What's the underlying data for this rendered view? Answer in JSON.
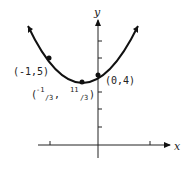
{
  "diagram": {
    "type": "parabola graph",
    "axes": {
      "x_label": "x",
      "y_label": "y"
    },
    "points": [
      {
        "label": "(-1,5)",
        "x": -1,
        "y": 5
      },
      {
        "label": "(0,4)",
        "x": 0,
        "y": 4
      },
      {
        "label_parts": {
          "open": "(",
          "x_num": "-1",
          "x_den": "3",
          "sep": ", ",
          "y_num": "11",
          "y_den": "3",
          "close": ")"
        },
        "x": -0.3333,
        "y": 3.6667
      }
    ],
    "colors": {
      "curve": "#111111",
      "axes": "#222222"
    }
  }
}
